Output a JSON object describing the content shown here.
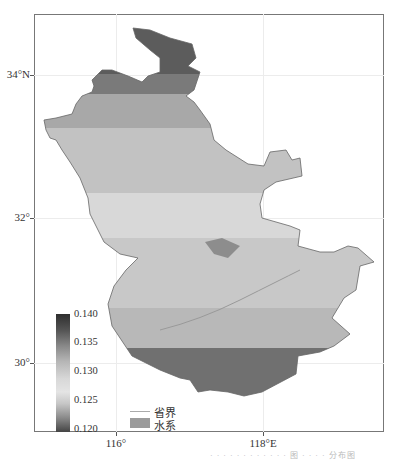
{
  "map": {
    "lat_labels": [
      {
        "label": "34°N",
        "y": 75
      },
      {
        "label": "32°",
        "y": 218
      },
      {
        "label": "30°",
        "y": 363
      }
    ],
    "lon_labels": [
      {
        "label": "116°",
        "x": 116
      },
      {
        "label": "118°E",
        "x": 263
      }
    ],
    "colorbar": {
      "ticks": [
        "0.140",
        "0.135",
        "0.130",
        "0.125",
        "0.120"
      ],
      "min": 0.12,
      "max": 0.14
    },
    "legend": {
      "boundary_label": "省界",
      "water_label": "水系"
    },
    "caption": "· · · · · · · · · · · · 图 · · · · 分布图"
  }
}
